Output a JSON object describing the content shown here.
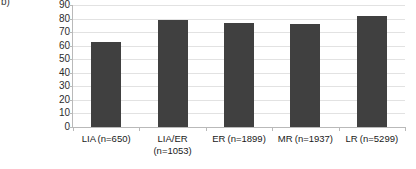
{
  "panel": {
    "letter": "b)"
  },
  "chart_data": {
    "type": "bar",
    "title": "",
    "subtitle": "",
    "xlabel": "",
    "ylabel": "% of phased burials within cemetery",
    "ylabel_lines": [
      "% of phased burials within",
      "cemetery"
    ],
    "categories": [
      "LIA (n=650)",
      "LIA/ER (n=1053)",
      "ER (n=1899)",
      "MR (n=1937)",
      "LR (n=5299)"
    ],
    "category_lines": [
      [
        "LIA (n=650)"
      ],
      [
        "LIA/ER",
        "(n=1053)"
      ],
      [
        "ER (n=1899)"
      ],
      [
        "MR (n=1937)"
      ],
      [
        "LR (n=5299)"
      ]
    ],
    "values": [
      63,
      79,
      77,
      76,
      82
    ],
    "ylim": [
      0,
      90
    ],
    "ytick_values": [
      0,
      10,
      20,
      30,
      40,
      50,
      60,
      70,
      80,
      90
    ],
    "ytick_labels": [
      "0",
      "10",
      "20",
      "30",
      "40",
      "50",
      "60",
      "70",
      "80",
      "90"
    ],
    "grid": true,
    "legend": false,
    "legend_position": "none",
    "bar_color": "#404040",
    "gridline_color": "#e2e2e2",
    "axis_color": "#b9b9b9",
    "text_color": "#1a1a1a"
  }
}
